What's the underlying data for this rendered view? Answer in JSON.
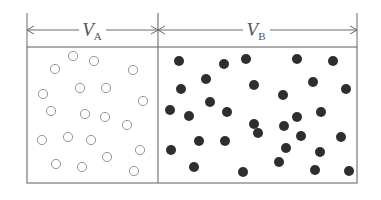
{
  "diagram": {
    "title": "",
    "colors": {
      "line": "#6b6b6b",
      "text": "#555555",
      "hollow_stroke": "#8a8a8a",
      "filled": "#2e2e2e",
      "background": "#ffffff"
    },
    "frame": {
      "left": 27,
      "divider": 158,
      "right": 357,
      "top": 47,
      "bottom": 183,
      "dim_line_y": 30,
      "tick_top": 13
    },
    "labels": {
      "left": {
        "main": "V",
        "sub": "A",
        "x": 92,
        "y": 36
      },
      "right": {
        "main": "V",
        "sub": "B",
        "x": 256,
        "y": 36
      }
    },
    "compartment_a": {
      "name": "V_A",
      "particle_style": "hollow",
      "radius": 4.6,
      "particles": [
        [
          73,
          56
        ],
        [
          94,
          61
        ],
        [
          55,
          69
        ],
        [
          133,
          70
        ],
        [
          80,
          88
        ],
        [
          106,
          88
        ],
        [
          43,
          94
        ],
        [
          143,
          101
        ],
        [
          51,
          111
        ],
        [
          85,
          114
        ],
        [
          105,
          117
        ],
        [
          127,
          125
        ],
        [
          42,
          140
        ],
        [
          68,
          137
        ],
        [
          91,
          140
        ],
        [
          107,
          157
        ],
        [
          140,
          150
        ],
        [
          56,
          164
        ],
        [
          82,
          167
        ],
        [
          134,
          171
        ]
      ]
    },
    "compartment_b": {
      "name": "V_B",
      "particle_style": "filled",
      "radius": 5,
      "particles": [
        [
          179,
          61
        ],
        [
          224,
          64
        ],
        [
          246,
          59
        ],
        [
          297,
          59
        ],
        [
          333,
          61
        ],
        [
          206,
          79
        ],
        [
          181,
          89
        ],
        [
          254,
          85
        ],
        [
          313,
          82
        ],
        [
          346,
          89
        ],
        [
          283,
          95
        ],
        [
          210,
          102
        ],
        [
          170,
          110
        ],
        [
          189,
          116
        ],
        [
          227,
          112
        ],
        [
          321,
          112
        ],
        [
          297,
          117
        ],
        [
          254,
          124
        ],
        [
          284,
          126
        ],
        [
          199,
          141
        ],
        [
          225,
          141
        ],
        [
          258,
          133
        ],
        [
          301,
          136
        ],
        [
          341,
          137
        ],
        [
          171,
          150
        ],
        [
          320,
          152
        ],
        [
          286,
          148
        ],
        [
          194,
          167
        ],
        [
          243,
          172
        ],
        [
          279,
          162
        ],
        [
          315,
          170
        ],
        [
          349,
          171
        ]
      ]
    }
  }
}
